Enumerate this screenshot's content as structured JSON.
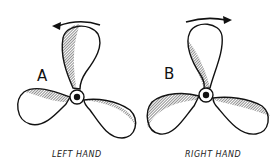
{
  "figure": {
    "top_text_fragment": "",
    "propellers": [
      {
        "id": "A",
        "letter": "A",
        "caption": "LEFT HAND",
        "rotation": "counterclockwise",
        "hub": [
          77,
          97
        ]
      },
      {
        "id": "B",
        "letter": "B",
        "caption": "RIGHT HAND",
        "rotation": "clockwise",
        "hub": [
          206,
          95
        ]
      }
    ]
  }
}
